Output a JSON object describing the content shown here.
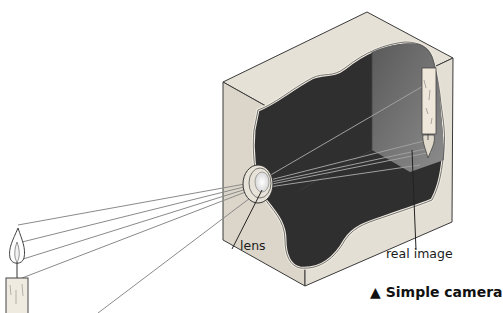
{
  "diagram": {
    "title": "Simple camera",
    "caption_marker": "▲",
    "caption": "Simple camera",
    "labels": {
      "lens": "lens",
      "real_image": "real image"
    },
    "components": [
      {
        "id": "object",
        "name": "candle (object)"
      },
      {
        "id": "lens",
        "name": "lens"
      },
      {
        "id": "camera_box",
        "name": "camera box (cutaway)"
      },
      {
        "id": "real_image",
        "name": "real image (inverted candle)"
      }
    ],
    "colors": {
      "wood": "#e2ddd2",
      "wood_dark": "#cfc9bc",
      "interior_dark": "#2e2e2e",
      "interior_back": "#6a6a6a",
      "ray": "#8a8a8a",
      "outline": "#3a3a3a"
    }
  }
}
